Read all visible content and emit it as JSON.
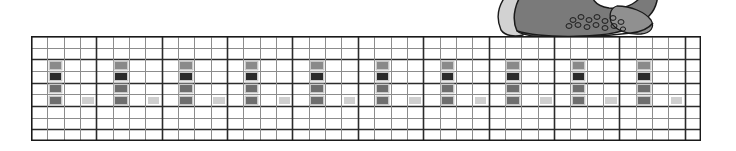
{
  "page": {
    "width": 736,
    "height": 151,
    "background": "#ffffff"
  },
  "illustration": {
    "name": "cropped-shoe-illustration",
    "description": "partially cropped grayscale illustration at top right",
    "x": 481,
    "y": 0,
    "width": 190,
    "height": 37,
    "colors": {
      "dark_gray": "#7a7a7a",
      "mid_gray": "#909090",
      "light_gray": "#d2d2d2",
      "outline": "#1a1a1a",
      "white": "#ffffff"
    }
  },
  "grid": {
    "name": "notation-grid",
    "x": 31,
    "y": 36,
    "width": 670,
    "height": 105,
    "columns": 41,
    "rows": 9,
    "col_width": 16.34,
    "row_height": 11.67,
    "bar_every": 4,
    "colors": {
      "thin_line": "#8c8c8c",
      "thick_line": "#2b2b2b",
      "border": "#1a1a1a",
      "cell_dark": "#2b2b2b",
      "cell_mid_dark": "#6e6e6e",
      "cell_mid": "#8a8a8a",
      "cell_light": "#cfcfcf",
      "cell_halo": "#c9c9c9"
    },
    "thick_rows": [
      0,
      2,
      4,
      6,
      8
    ],
    "marks": [
      {
        "col": 1,
        "row": 2,
        "color": "cell_mid"
      },
      {
        "col": 1,
        "row": 3,
        "color": "cell_dark"
      },
      {
        "col": 1,
        "row": 4,
        "color": "cell_mid_dark"
      },
      {
        "col": 1,
        "row": 5,
        "color": "cell_mid_dark"
      },
      {
        "col": 3,
        "row": 5,
        "color": "cell_light"
      },
      {
        "col": 5,
        "row": 2,
        "color": "cell_mid"
      },
      {
        "col": 5,
        "row": 3,
        "color": "cell_dark"
      },
      {
        "col": 5,
        "row": 4,
        "color": "cell_mid_dark"
      },
      {
        "col": 5,
        "row": 5,
        "color": "cell_mid_dark"
      },
      {
        "col": 7,
        "row": 5,
        "color": "cell_light"
      },
      {
        "col": 9,
        "row": 2,
        "color": "cell_mid"
      },
      {
        "col": 9,
        "row": 3,
        "color": "cell_dark"
      },
      {
        "col": 9,
        "row": 4,
        "color": "cell_mid_dark"
      },
      {
        "col": 9,
        "row": 5,
        "color": "cell_mid_dark"
      },
      {
        "col": 11,
        "row": 5,
        "color": "cell_light"
      },
      {
        "col": 13,
        "row": 2,
        "color": "cell_mid"
      },
      {
        "col": 13,
        "row": 3,
        "color": "cell_dark"
      },
      {
        "col": 13,
        "row": 4,
        "color": "cell_mid_dark"
      },
      {
        "col": 13,
        "row": 5,
        "color": "cell_mid_dark"
      },
      {
        "col": 15,
        "row": 5,
        "color": "cell_light"
      },
      {
        "col": 17,
        "row": 2,
        "color": "cell_mid"
      },
      {
        "col": 17,
        "row": 3,
        "color": "cell_dark"
      },
      {
        "col": 17,
        "row": 4,
        "color": "cell_mid_dark"
      },
      {
        "col": 17,
        "row": 5,
        "color": "cell_mid_dark"
      },
      {
        "col": 19,
        "row": 5,
        "color": "cell_light"
      },
      {
        "col": 21,
        "row": 2,
        "color": "cell_mid"
      },
      {
        "col": 21,
        "row": 3,
        "color": "cell_dark"
      },
      {
        "col": 21,
        "row": 4,
        "color": "cell_mid_dark"
      },
      {
        "col": 21,
        "row": 5,
        "color": "cell_mid_dark"
      },
      {
        "col": 23,
        "row": 5,
        "color": "cell_light"
      },
      {
        "col": 25,
        "row": 2,
        "color": "cell_mid"
      },
      {
        "col": 25,
        "row": 3,
        "color": "cell_dark"
      },
      {
        "col": 25,
        "row": 4,
        "color": "cell_mid_dark"
      },
      {
        "col": 25,
        "row": 5,
        "color": "cell_mid_dark"
      },
      {
        "col": 27,
        "row": 5,
        "color": "cell_light"
      },
      {
        "col": 29,
        "row": 2,
        "color": "cell_mid"
      },
      {
        "col": 29,
        "row": 3,
        "color": "cell_dark"
      },
      {
        "col": 29,
        "row": 4,
        "color": "cell_mid_dark"
      },
      {
        "col": 29,
        "row": 5,
        "color": "cell_mid_dark"
      },
      {
        "col": 31,
        "row": 5,
        "color": "cell_light"
      },
      {
        "col": 33,
        "row": 2,
        "color": "cell_mid"
      },
      {
        "col": 33,
        "row": 3,
        "color": "cell_dark"
      },
      {
        "col": 33,
        "row": 4,
        "color": "cell_mid_dark"
      },
      {
        "col": 33,
        "row": 5,
        "color": "cell_mid_dark"
      },
      {
        "col": 35,
        "row": 5,
        "color": "cell_light"
      },
      {
        "col": 37,
        "row": 2,
        "color": "cell_mid"
      },
      {
        "col": 37,
        "row": 3,
        "color": "cell_dark"
      },
      {
        "col": 37,
        "row": 4,
        "color": "cell_mid_dark"
      },
      {
        "col": 37,
        "row": 5,
        "color": "cell_mid_dark"
      },
      {
        "col": 39,
        "row": 5,
        "color": "cell_light"
      }
    ]
  }
}
